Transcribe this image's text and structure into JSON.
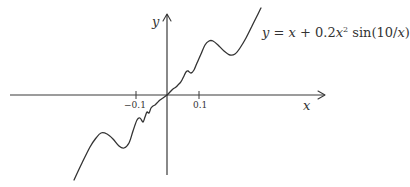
{
  "figure": {
    "x_axis_label": "x",
    "y_axis_label": "y",
    "tick_labels": {
      "neg": "−0.1",
      "pos": "0.1"
    },
    "formula": {
      "lhs": "y",
      "eq": " = ",
      "x1": "x",
      "plus": " + 0.2",
      "x2": "x",
      "exp": "2",
      "sin": " sin(10/",
      "x3": "x",
      "close": ")"
    },
    "colors": {
      "axis": "#3a3a3a",
      "curve": "#333333",
      "background": "#ffffff"
    }
  },
  "chart_data": {
    "type": "line",
    "function": "y = x + 0.2*x^2*sin(10/x)",
    "xlabel": "x",
    "ylabel": "y",
    "x_ticks": [
      -0.1,
      0.1
    ],
    "x_tick_labels": [
      "−0.1",
      "0.1"
    ],
    "xlim": [
      -0.5,
      0.5
    ],
    "grid": false,
    "legend": null,
    "origin_px": [
      167,
      95
    ],
    "traced_points_px": [
      [
        74,
        180
      ],
      [
        82,
        163
      ],
      [
        90,
        147
      ],
      [
        96,
        138
      ],
      [
        101,
        133
      ],
      [
        107,
        134
      ],
      [
        113,
        139
      ],
      [
        119,
        146
      ],
      [
        124,
        148
      ],
      [
        129,
        143
      ],
      [
        133,
        131
      ],
      [
        137,
        120
      ],
      [
        140,
        118
      ],
      [
        143,
        122
      ],
      [
        145,
        117
      ],
      [
        147,
        112
      ],
      [
        149,
        113
      ],
      [
        151,
        108
      ],
      [
        153,
        106
      ],
      [
        155,
        105
      ],
      [
        157,
        103
      ],
      [
        160,
        100
      ],
      [
        163,
        98
      ],
      [
        167,
        95
      ],
      [
        170,
        92
      ],
      [
        173,
        89
      ],
      [
        176,
        87
      ],
      [
        178,
        85
      ],
      [
        180,
        83
      ],
      [
        182,
        80
      ],
      [
        184,
        76
      ],
      [
        186,
        72
      ],
      [
        188,
        71
      ],
      [
        191,
        73
      ],
      [
        194,
        70
      ],
      [
        197,
        63
      ],
      [
        201,
        54
      ],
      [
        205,
        45
      ],
      [
        209,
        41
      ],
      [
        213,
        41
      ],
      [
        218,
        45
      ],
      [
        224,
        51
      ],
      [
        230,
        55
      ],
      [
        235,
        54
      ],
      [
        240,
        48
      ],
      [
        246,
        38
      ],
      [
        252,
        26
      ],
      [
        257,
        16
      ],
      [
        261,
        8
      ]
    ]
  }
}
